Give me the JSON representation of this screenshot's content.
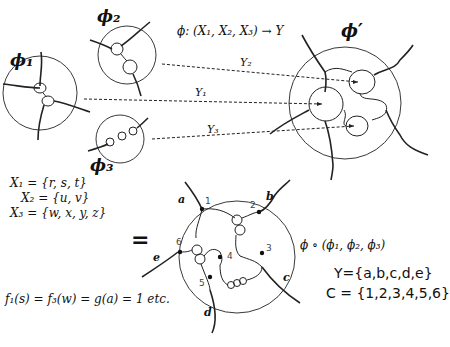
{
  "diagram": {
    "top": {
      "phi1_label": "ϕ₁",
      "phi2_label": "ϕ₂",
      "phi3_label": "ϕ₃",
      "phi_prime_label": "ϕ′",
      "mapping_equation": "ϕ: (X₁, X₂, X₃) → Y",
      "arrows": [
        {
          "label": "Y₂"
        },
        {
          "label": "Y₁"
        },
        {
          "label": "Y₃"
        }
      ]
    },
    "sets": {
      "x1": "X₁ = {r, s, t}",
      "x2": "X₂ = {u, v}",
      "x3": "X₃ = {w, x, y, z}"
    },
    "equals_sign": "=",
    "function_equation": "f₁(s) = f₃(w) = g(a) = 1  etc.",
    "composite": {
      "outer_labels": [
        "a",
        "b",
        "c",
        "d",
        "e"
      ],
      "inner_numbers": [
        "1",
        "2",
        "3",
        "4",
        "5",
        "6"
      ],
      "composition_label": "ϕ ∘ (ϕ₁, ϕ₂, ϕ₃)",
      "y_set": "Y={a,b,c,d,e}",
      "c_set": "C = {1,2,3,4,5,6}"
    }
  }
}
